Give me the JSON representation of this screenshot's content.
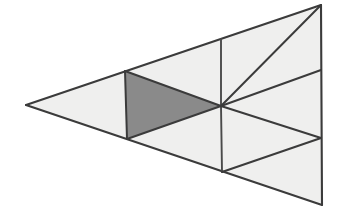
{
  "figure": {
    "type": "geometric-diagram",
    "canvas": {
      "width": 348,
      "height": 213,
      "background": "#ffffff"
    },
    "colors": {
      "background": "#ffffff",
      "light_fill": "#efefee",
      "shaded_fill": "#8a8a8a",
      "stroke": "#3b3b3b",
      "stroke_soft": "#4a4a4a"
    },
    "stroke_width": 2.0,
    "vertices": {
      "left_apex": {
        "x": 26,
        "y": 105
      },
      "top_right": {
        "x": 321,
        "y": 5
      },
      "bottom_right": {
        "x": 322,
        "y": 205
      },
      "center_hub": {
        "x": 221,
        "y": 106
      },
      "top_mid": {
        "x": 221,
        "y": 39
      },
      "bottom_mid": {
        "x": 222,
        "y": 172
      },
      "right_upper": {
        "x": 321,
        "y": 70
      },
      "right_lower": {
        "x": 321,
        "y": 138
      },
      "left_bar_top": {
        "x": 125,
        "y": 71
      },
      "left_bar_bottom": {
        "x": 127,
        "y": 139
      }
    },
    "regions": [
      {
        "id": "far-left-wedge",
        "label": "Far left wedge",
        "shaded": false,
        "fill": "#efefee",
        "points": "26,105 125,71 127,139"
      },
      {
        "id": "upper-left-band",
        "label": "Upper left band",
        "shaded": false,
        "fill": "#efefee",
        "points": "125,71 221,39 221,106"
      },
      {
        "id": "shaded-triangle",
        "label": "Shaded triangle",
        "shaded": true,
        "fill": "#8a8a8a",
        "points": "125,71 221,106 127,139"
      },
      {
        "id": "lower-left-band",
        "label": "Lower left band",
        "shaded": false,
        "fill": "#efefee",
        "points": "127,139 221,106 222,172"
      },
      {
        "id": "upper-middle-cell",
        "label": "Upper middle cell",
        "shaded": false,
        "fill": "#efefee",
        "points": "221,39 321,5 221,106"
      },
      {
        "id": "upper-right-cell",
        "label": "Upper right cell",
        "shaded": false,
        "fill": "#efefee",
        "points": "321,5 321,70 221,106"
      },
      {
        "id": "middle-right-cell",
        "label": "Middle right cell",
        "shaded": false,
        "fill": "#efefee",
        "points": "221,106 321,70 321,138"
      },
      {
        "id": "lower-right-cell",
        "label": "Lower right cell",
        "shaded": false,
        "fill": "#efefee",
        "points": "221,106 321,138 222,172"
      },
      {
        "id": "bottom-right-cell",
        "label": "Bottom right cell",
        "shaded": false,
        "fill": "#efefee",
        "points": "222,172 321,138 322,205"
      }
    ],
    "edges": [
      {
        "id": "outer-top",
        "label": "Outer top edge",
        "d": "M 26,105 L 321,5"
      },
      {
        "id": "outer-right",
        "label": "Outer right edge",
        "d": "M 321,5 L 322,205"
      },
      {
        "id": "outer-bottom",
        "label": "Outer bottom edge",
        "d": "M 322,205 L 26,105"
      },
      {
        "id": "median-hub-to-top",
        "label": "Vertical to top edge",
        "d": "M 221,39 L 221,106"
      },
      {
        "id": "median-hub-to-bot",
        "label": "Vertical to bottom edge",
        "d": "M 221,106 L 222,172"
      },
      {
        "id": "left-bar",
        "label": "Left vertical bar",
        "d": "M 125,71 L 127,139"
      },
      {
        "id": "upper-chord",
        "label": "Upper chord to hub",
        "d": "M 125,71 L 221,106"
      },
      {
        "id": "lower-chord",
        "label": "Lower chord to hub",
        "d": "M 127,139 L 221,106"
      },
      {
        "id": "hub-to-right-upper",
        "label": "Hub to upper right vertex",
        "d": "M 221,106 L 321,70"
      },
      {
        "id": "hub-to-right-lower",
        "label": "Hub to lower right vertex",
        "d": "M 221,106 L 321,138"
      },
      {
        "id": "right-upper-to-top",
        "label": "Upper right slant",
        "d": "M 321,5 L 221,106"
      },
      {
        "id": "right-lower-to-bot",
        "label": "Lower right slant",
        "d": "M 222,172 L 321,138"
      }
    ]
  }
}
